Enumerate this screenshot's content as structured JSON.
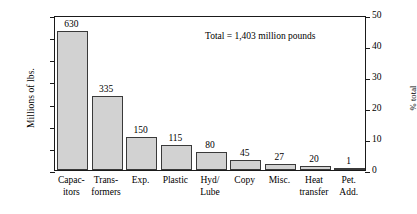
{
  "chart_data": {
    "type": "bar",
    "title": "",
    "xlabel": "",
    "ylabel": "Millions of lbs.",
    "y2label": "% total",
    "ylim": [
      0,
      700
    ],
    "y2lim": [
      0,
      50
    ],
    "grid": false,
    "legend": null,
    "categories": [
      "Capac-\nitors",
      "Trans-\nformers",
      "Exp.",
      "Plastic",
      "Hyd/\nLube",
      "Copy",
      "Misc.",
      "Heat\ntransfer",
      "Pet.\nAdd."
    ],
    "values": [
      630,
      335,
      150,
      115,
      80,
      45,
      27,
      20,
      1
    ],
    "value_labels": [
      "630",
      "335",
      "150",
      "115",
      "80",
      "45",
      "27",
      "20",
      "1"
    ],
    "yticks": [
      0,
      100,
      200,
      300,
      400,
      500,
      600,
      700
    ],
    "ytick_labels": [
      "0",
      "100",
      "200",
      "300",
      "400",
      "500",
      "600",
      "700"
    ],
    "y2ticks": [
      0,
      10,
      20,
      30,
      40,
      50
    ],
    "y2tick_labels": [
      "0",
      "10",
      "20",
      "30",
      "40",
      "50"
    ],
    "annotations": [
      {
        "text": "Total = 1,403 million pounds"
      }
    ],
    "colors": {
      "bar_fill": "#d2d2d2",
      "bar_edge": "#3a3a3a",
      "axis": "#1a1a1a",
      "background": "#ffffff",
      "text": "#000000"
    }
  }
}
